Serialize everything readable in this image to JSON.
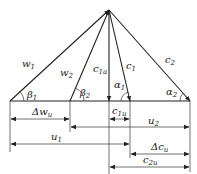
{
  "diagram": {
    "title": "",
    "type": "velocity-triangle",
    "colors": {
      "line": "#222222",
      "background": "#ffffff"
    },
    "vectors": [
      {
        "id": "w1",
        "label": "w",
        "sub": "1"
      },
      {
        "id": "w2",
        "label": "w",
        "sub": "2"
      },
      {
        "id": "c1a",
        "label": "c",
        "sub": "1a"
      },
      {
        "id": "c1",
        "label": "c",
        "sub": "1"
      },
      {
        "id": "c2",
        "label": "c",
        "sub": "2"
      }
    ],
    "angles": [
      {
        "id": "beta1",
        "label": "β",
        "sub": "1"
      },
      {
        "id": "beta2",
        "label": "β",
        "sub": "2"
      },
      {
        "id": "alpha1",
        "label": "α",
        "sub": "1"
      },
      {
        "id": "alpha2",
        "label": "α",
        "sub": "2"
      }
    ],
    "dimensions": [
      {
        "id": "delta_wu",
        "label": "Δw",
        "sub": "u"
      },
      {
        "id": "c1u",
        "label": "c",
        "sub": "1u"
      },
      {
        "id": "u2",
        "label": "u",
        "sub": "2"
      },
      {
        "id": "u1",
        "label": "u",
        "sub": "1"
      },
      {
        "id": "delta_cu",
        "label": "Δc",
        "sub": "u"
      },
      {
        "id": "c2u",
        "label": "c",
        "sub": "2u"
      }
    ]
  }
}
